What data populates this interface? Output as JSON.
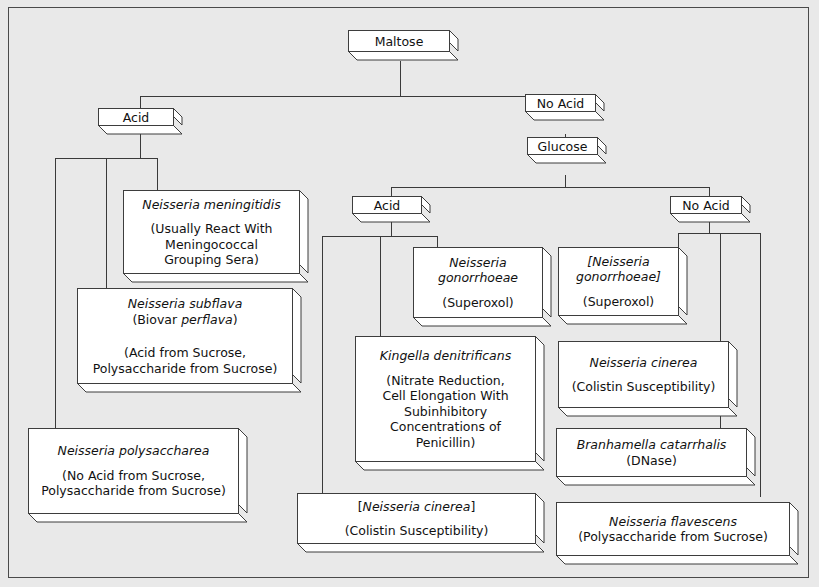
{
  "diagram": {
    "root": {
      "label": "Maltose"
    },
    "branches": {
      "maltose_acid": "Acid",
      "maltose_no_acid": "No Acid",
      "glucose": "Glucose",
      "glucose_acid": "Acid",
      "glucose_no_acid": "No Acid"
    },
    "nodes": [
      {
        "id": "n-meningitidis",
        "species": "Neisseria meningitidis",
        "bracketed": false,
        "notes": [
          "(Usually React With",
          "Meningococcal",
          "Grouping Sera)"
        ]
      },
      {
        "id": "n-subflava",
        "species": "Neisseria subflava",
        "species_line2_prefix": "(Biovar ",
        "species_line2_italic": "perflava",
        "species_line2_suffix": ")",
        "bracketed": false,
        "notes": [
          "(Acid from Sucrose,",
          "Polysaccharide from Sucrose)"
        ]
      },
      {
        "id": "n-polysaccharea",
        "species": "Neisseria polysaccharea",
        "bracketed": false,
        "notes": [
          "(No Acid from Sucrose,",
          "Polysaccharide from Sucrose)"
        ]
      },
      {
        "id": "n-gonorrhoeae",
        "species_line1": "Neisseria",
        "species_line2": "gonorrhoeae",
        "bracketed": false,
        "notes": [
          "(Superoxol)"
        ]
      },
      {
        "id": "n-gonorrhoeae-bracketed",
        "species_line1": "[Neisseria",
        "species_line2": "gonorrhoeae]",
        "bracketed": true,
        "notes": [
          "(Superoxol)"
        ]
      },
      {
        "id": "k-denitrificans",
        "species": "Kingella denitrificans",
        "bracketed": false,
        "notes": [
          "(Nitrate Reduction,",
          "Cell Elongation With",
          "Subinhibitory",
          "Concentrations of",
          "Penicillin)"
        ]
      },
      {
        "id": "n-cinerea-right",
        "species": "Neisseria cinerea",
        "bracketed": false,
        "notes": [
          "(Colistin Susceptibility)"
        ]
      },
      {
        "id": "b-catarrhalis",
        "species": "Branhamella catarrhalis",
        "bracketed": false,
        "notes": [
          "(DNase)"
        ]
      },
      {
        "id": "n-flavescens",
        "species": "Neisseria flavescens",
        "bracketed": false,
        "notes": [
          "(Polysaccharide from Sucrose)"
        ]
      },
      {
        "id": "n-cinerea-bracketed",
        "species_open": "[",
        "species": "Neisseria cinerea",
        "species_close": "]",
        "bracketed": true,
        "notes": [
          "(Colistin Susceptibility)"
        ]
      }
    ],
    "colors": {
      "background": "#e9e9e9",
      "box_fill": "#ffffff",
      "line": "#3a3a3a",
      "text": "#111111",
      "frame": "#4a4a4a"
    }
  }
}
